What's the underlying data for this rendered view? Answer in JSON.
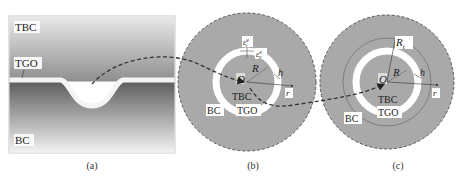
{
  "panels": {
    "a": {
      "caption": "(a)",
      "labels": {
        "tbc": "TBC",
        "tgo": "TGO",
        "bc": "BC"
      }
    },
    "b": {
      "caption": "(b)",
      "labels": {
        "origin": "O",
        "radius": "R",
        "thickness": "h",
        "radial_axis": "r",
        "tbc": "TBC",
        "tgo": "TGO",
        "bc": "BC",
        "strain_r": "ε",
        "strain_r_sup": "g",
        "strain_r_sub": "r",
        "strain_theta": "ε",
        "strain_theta_sup": "g",
        "strain_theta_sub": "θ"
      }
    },
    "c": {
      "caption": "(c)",
      "labels": {
        "origin": "O",
        "radius": "R",
        "outer_radius": "R",
        "outer_radius_sub": "t",
        "thickness": "h",
        "radial_axis": "r",
        "tbc": "TBC",
        "tgo": "TGO",
        "bc": "BC"
      }
    }
  },
  "colors": {
    "circle_fill": "#a9a9a9",
    "circle_border": "#555555",
    "tgo_ring": "#ffffff",
    "label_bg": "#ffffff",
    "dashed_path": "#333333"
  }
}
